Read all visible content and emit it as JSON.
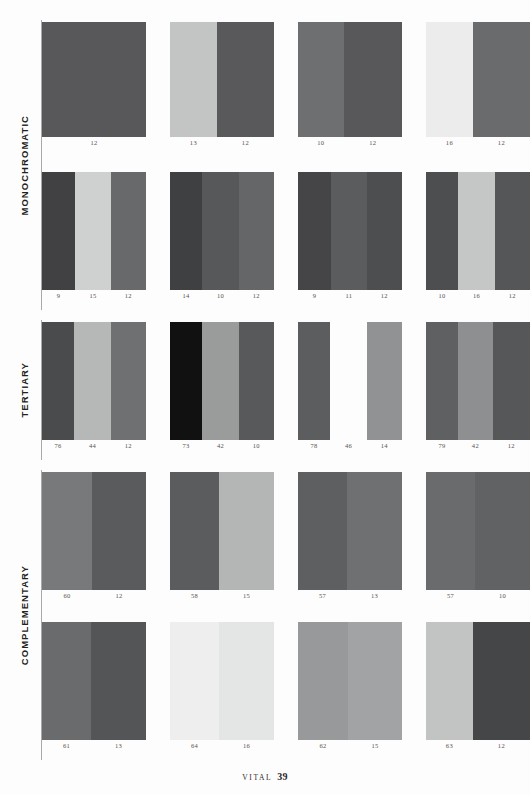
{
  "page": {
    "footer_label": "VITAL",
    "footer_page_number": "39",
    "background": "#fdfdfd"
  },
  "sections": [
    {
      "id": "monochromatic",
      "label": "MONOCHROMATIC",
      "top": 20,
      "height": 290
    },
    {
      "id": "tertiary",
      "label": "TERTIARY",
      "top": 320,
      "height": 140
    },
    {
      "id": "complementary",
      "label": "COMPLEMENTARY",
      "top": 470,
      "height": 290
    }
  ],
  "rows": [
    {
      "id": "row-1",
      "section": "monochromatic",
      "top": 22,
      "swatch_height": 115,
      "cells": [
        {
          "bars": [
            {
              "color": "#58585a",
              "width": 100
            }
          ],
          "labels": [
            "12"
          ]
        },
        {
          "bars": [
            {
              "color": "#c3c4c4",
              "width": 45
            },
            {
              "color": "#59595b",
              "width": 55
            }
          ],
          "labels": [
            "13",
            "12"
          ]
        },
        {
          "bars": [
            {
              "color": "#6e6f71",
              "width": 44
            },
            {
              "color": "#58585a",
              "width": 56
            }
          ],
          "labels": [
            "10",
            "12"
          ]
        },
        {
          "bars": [
            {
              "color": "#ececec",
              "width": 45
            },
            {
              "color": "#6a6b6d",
              "width": 55
            }
          ],
          "labels": [
            "16",
            "12"
          ]
        }
      ]
    },
    {
      "id": "row-2",
      "section": "monochromatic",
      "top": 172,
      "swatch_height": 118,
      "cells": [
        {
          "bars": [
            {
              "color": "#414143",
              "width": 32
            },
            {
              "color": "#cfd0d0",
              "width": 34
            },
            {
              "color": "#68696b",
              "width": 34
            }
          ],
          "labels": [
            "9",
            "15",
            "12"
          ]
        },
        {
          "bars": [
            {
              "color": "#3f4042",
              "width": 31
            },
            {
              "color": "#57585a",
              "width": 35
            },
            {
              "color": "#656668",
              "width": 34
            }
          ],
          "labels": [
            "14",
            "10",
            "12"
          ]
        },
        {
          "bars": [
            {
              "color": "#454547",
              "width": 32
            },
            {
              "color": "#5b5c5e",
              "width": 34
            },
            {
              "color": "#4d4e50",
              "width": 34
            }
          ],
          "labels": [
            "9",
            "11",
            "12"
          ]
        },
        {
          "bars": [
            {
              "color": "#4d4e50",
              "width": 31
            },
            {
              "color": "#c5c6c6",
              "width": 35
            },
            {
              "color": "#555658",
              "width": 34
            }
          ],
          "labels": [
            "10",
            "16",
            "12"
          ]
        }
      ]
    },
    {
      "id": "row-3",
      "section": "tertiary",
      "top": 322,
      "swatch_height": 118,
      "cells": [
        {
          "bars": [
            {
              "color": "#4a4b4d",
              "width": 31
            },
            {
              "color": "#b6b7b7",
              "width": 35
            },
            {
              "color": "#6f7072",
              "width": 34
            }
          ],
          "labels": [
            "76",
            "44",
            "12"
          ]
        },
        {
          "bars": [
            {
              "color": "#111112",
              "width": 31
            },
            {
              "color": "#9a9b9b",
              "width": 35
            },
            {
              "color": "#58595b",
              "width": 34
            }
          ],
          "labels": [
            "73",
            "42",
            "10"
          ]
        },
        {
          "bars": [
            {
              "color": "#5c5d5f",
              "width": 31
            },
            {
              "color": "#c9cacа",
              "width": 35
            },
            {
              "color": "#919293",
              "width": 34
            }
          ],
          "labels": [
            "78",
            "46",
            "14"
          ]
        },
        {
          "bars": [
            {
              "color": "#5f6062",
              "width": 31
            },
            {
              "color": "#8e8f90",
              "width": 33
            },
            {
              "color": "#565759",
              "width": 36
            }
          ],
          "labels": [
            "79",
            "42",
            "12"
          ]
        }
      ]
    },
    {
      "id": "row-4",
      "section": "complementary",
      "top": 472,
      "swatch_height": 118,
      "cells": [
        {
          "bars": [
            {
              "color": "#78797b",
              "width": 48
            },
            {
              "color": "#5a5b5d",
              "width": 52
            }
          ],
          "labels": [
            "60",
            "12"
          ]
        },
        {
          "bars": [
            {
              "color": "#5b5c5e",
              "width": 47
            },
            {
              "color": "#b4b5b5",
              "width": 53
            }
          ],
          "labels": [
            "58",
            "15"
          ]
        },
        {
          "bars": [
            {
              "color": "#5e5f61",
              "width": 47
            },
            {
              "color": "#6f7072",
              "width": 53
            }
          ],
          "labels": [
            "57",
            "13"
          ]
        },
        {
          "bars": [
            {
              "color": "#6a6b6d",
              "width": 47
            },
            {
              "color": "#616264",
              "width": 53
            }
          ],
          "labels": [
            "57",
            "10"
          ]
        }
      ]
    },
    {
      "id": "row-5",
      "section": "complementary",
      "top": 622,
      "swatch_height": 118,
      "cells": [
        {
          "bars": [
            {
              "color": "#6a6b6d",
              "width": 47
            },
            {
              "color": "#545557",
              "width": 53
            }
          ],
          "labels": [
            "61",
            "13"
          ]
        },
        {
          "bars": [
            {
              "color": "#eeeeee",
              "width": 47
            },
            {
              "color": "#e4e5e5",
              "width": 53
            }
          ],
          "labels": [
            "64",
            "16"
          ]
        },
        {
          "bars": [
            {
              "color": "#98999a",
              "width": 48
            },
            {
              "color": "#a2a3a4",
              "width": 52
            }
          ],
          "labels": [
            "62",
            "15"
          ]
        },
        {
          "bars": [
            {
              "color": "#c2c3c3",
              "width": 45
            },
            {
              "color": "#454648",
              "width": 55
            }
          ],
          "labels": [
            "63",
            "12"
          ]
        }
      ]
    }
  ],
  "layout": {
    "cell_lefts": [
      0,
      128,
      256,
      384
    ],
    "cell_widths": [
      104,
      104,
      104,
      104
    ]
  }
}
